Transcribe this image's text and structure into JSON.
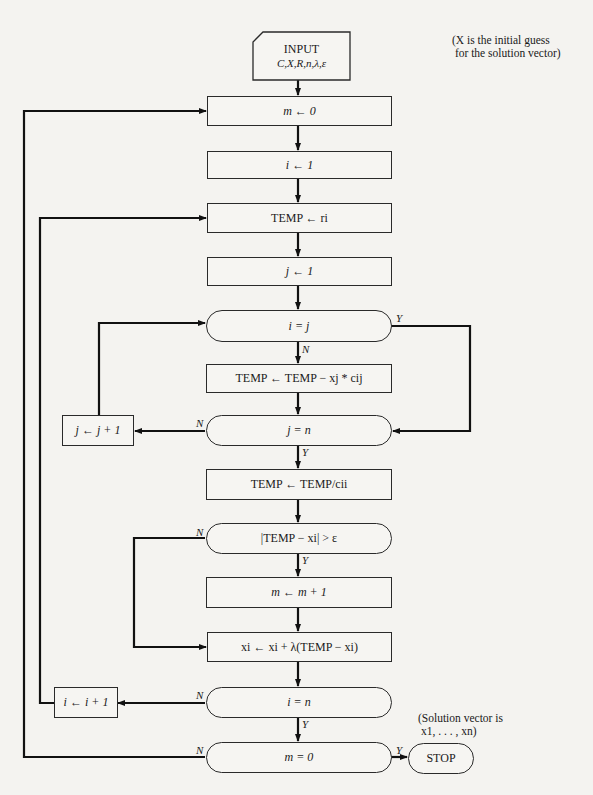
{
  "notes": {
    "initial_guess": "(X is the initial guess\n for the solution vector)",
    "solution": "(Solution vector is\n x1, . . . , xn)"
  },
  "nodes": {
    "input_title": "INPUT",
    "input_params": "C,X,R,n,λ,ε",
    "m_init": "m ← 0",
    "i_init": "i ← 1",
    "temp_init": "TEMP ← ri",
    "j_init": "j ← 1",
    "cond_i_eq_j": "i = j",
    "temp_update": "TEMP ← TEMP − xj * cij",
    "cond_j_eq_n": "j = n",
    "j_incr": "j ← j + 1",
    "temp_div": "TEMP ← TEMP/cii",
    "cond_converge": "|TEMP − xi| > ε",
    "m_incr": "m ← m + 1",
    "x_update": "xi ← xi + λ(TEMP − xi)",
    "cond_i_eq_n": "i = n",
    "i_incr": "i ← i + 1",
    "cond_m_eq_0": "m = 0",
    "stop": "STOP"
  },
  "edge_labels": {
    "yes": "Y",
    "no": "N"
  }
}
